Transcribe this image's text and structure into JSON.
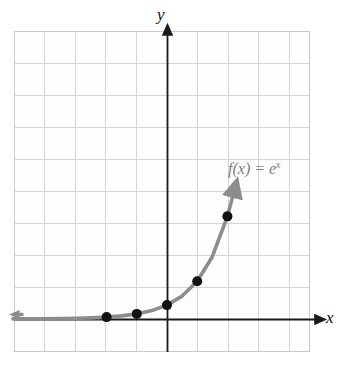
{
  "figure": {
    "kind": "cartesian-graph",
    "background_color": "#ffffff",
    "grid": {
      "visible": true,
      "left": 14,
      "top": 31,
      "width": 296,
      "height": 321,
      "cell_size": 30.2,
      "line_color": "#d2d2d2",
      "border_color": "#cccccc"
    },
    "axes": {
      "color": "#1a1a1a",
      "origin": {
        "x": 167,
        "y": 319
      },
      "x_axis": {
        "label": "x",
        "arrow": "right",
        "start_x": 14,
        "end_x": 318,
        "y": 319
      },
      "y_axis": {
        "label": "y",
        "arrow": "up",
        "x": 167,
        "start_y": 352,
        "end_y": 33
      }
    },
    "curve": {
      "label": "f(x) = e",
      "label_exponent": "x",
      "color": "#8c8c8c",
      "stroke_width": 3.4,
      "arrow_left": true,
      "arrow_up": true
    },
    "points": {
      "color": "#111111",
      "radius": 5,
      "items": [
        {
          "x": -2,
          "y": 0.135,
          "px": 105,
          "py": 312
        },
        {
          "x": -1,
          "y": 0.368,
          "px": 136,
          "py": 310
        },
        {
          "x": 0,
          "y": 1,
          "px": 167,
          "py": 287
        },
        {
          "x": 1,
          "y": 2.718,
          "px": 197,
          "py": 230
        },
        {
          "x": 2,
          "y": 7.389,
          "px": 228,
          "py": 84
        }
      ]
    }
  },
  "chart_data": {
    "type": "line",
    "title": "",
    "xlabel": "x",
    "ylabel": "y",
    "function": "f(x) = e^x",
    "series": [
      {
        "name": "f(x) = e^x",
        "color": "#8c8c8c",
        "x": [
          -5.1,
          -4.5,
          -4,
          -3.5,
          -3,
          -2.5,
          -2,
          -1.5,
          -1,
          -0.5,
          0,
          0.5,
          1,
          1.5,
          2,
          2.2
        ],
        "values": [
          0.006,
          0.011,
          0.018,
          0.03,
          0.05,
          0.082,
          0.135,
          0.223,
          0.368,
          0.607,
          1.0,
          1.649,
          2.718,
          4.482,
          7.389,
          9.025
        ]
      }
    ],
    "marked_points": [
      {
        "x": -2,
        "y": 0.135
      },
      {
        "x": -1,
        "y": 0.368
      },
      {
        "x": 0,
        "y": 1
      },
      {
        "x": 1,
        "y": 2.718
      },
      {
        "x": 2,
        "y": 7.389
      }
    ],
    "xlim": [
      -5.1,
      5
    ],
    "ylim": [
      -1.1,
      9.5
    ],
    "grid": true,
    "legend": "none",
    "annotations": [
      {
        "text": "f(x) = e^x",
        "x": 2.1,
        "y": 4.4
      }
    ]
  }
}
